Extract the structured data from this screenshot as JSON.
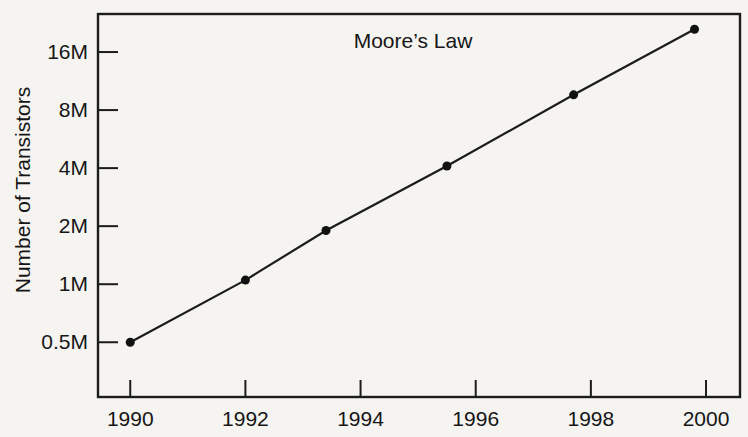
{
  "colors": {
    "ink": "#1c1c1c",
    "paper": "#f5f4f1"
  },
  "chart_data": {
    "type": "line",
    "title": "Moore’s Law",
    "xlabel": "",
    "ylabel": "Number of Transistors",
    "y_scale": "log2",
    "grid": false,
    "legend": false,
    "xlim": [
      1989.44,
      2000.59
    ],
    "ylim_millions": [
      0.26,
      25.2
    ],
    "x_ticks": [
      "1990",
      "1992",
      "1994",
      "1996",
      "1998",
      "2000"
    ],
    "y_ticks": [
      {
        "value": 0.5,
        "label": "0.5M"
      },
      {
        "value": 1,
        "label": "1M"
      },
      {
        "value": 2,
        "label": "2M"
      },
      {
        "value": 4,
        "label": "4M"
      },
      {
        "value": 8,
        "label": "8M"
      },
      {
        "value": 16,
        "label": "16M"
      }
    ],
    "series": [
      {
        "name": "transistor-count",
        "points": [
          {
            "year": 1990.0,
            "transistors_millions": 0.5
          },
          {
            "year": 1992.0,
            "transistors_millions": 1.05
          },
          {
            "year": 1993.4,
            "transistors_millions": 1.9
          },
          {
            "year": 1995.5,
            "transistors_millions": 4.1
          },
          {
            "year": 1997.7,
            "transistors_millions": 9.6
          },
          {
            "year": 1999.8,
            "transistors_millions": 21.0
          }
        ]
      }
    ]
  }
}
